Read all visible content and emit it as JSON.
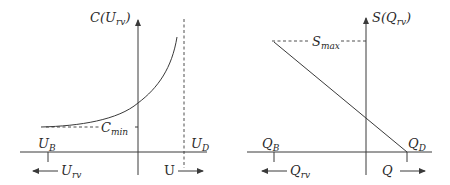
{
  "left_panel": {
    "y_axis_label": {
      "main": "C(U",
      "sub": "rv",
      "close": ")"
    },
    "min_label": {
      "main": "C",
      "sub": "min"
    },
    "bound_left": {
      "main": "U",
      "sub": "B"
    },
    "bound_right": {
      "main": "U",
      "sub": "D"
    },
    "direction_left": {
      "main": "U",
      "sub": "rv",
      "arrow": "left"
    },
    "direction_right": {
      "main": "U",
      "arrow": "right"
    },
    "description": "Convex increasing cost curve approaching a vertical dashed asymptote at U_D, flattening toward C_min at U_B"
  },
  "right_panel": {
    "y_axis_label": {
      "main": "S(Q",
      "sub": "rv",
      "close": ")"
    },
    "max_label": {
      "main": "S",
      "sub": "max"
    },
    "bound_left": {
      "main": "Q",
      "sub": "B"
    },
    "bound_right": {
      "main": "Q",
      "sub": "D"
    },
    "direction_left": {
      "main": "Q",
      "sub": "rv",
      "arrow": "left"
    },
    "direction_right": {
      "main": "Q",
      "arrow": "right"
    },
    "description": "Linear decreasing line from S_max at Q_B down to zero at Q_D"
  },
  "colors": {
    "ink": "#3a3a3a",
    "background": "#ffffff"
  }
}
